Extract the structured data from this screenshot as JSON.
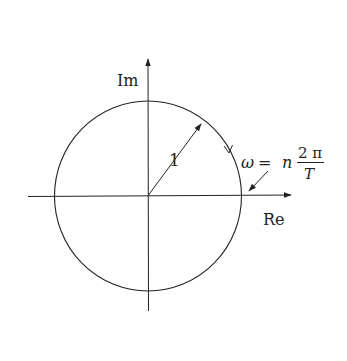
{
  "diagram": {
    "type": "unit-circle-complex-plane",
    "axes": {
      "real_label": "Re",
      "imag_label": "Im"
    },
    "radius_label": "1",
    "frequency_label": {
      "lhs": "ω",
      "equals": "=",
      "n": "n",
      "numerator": "2 π",
      "denominator": "T"
    },
    "rotation_direction": "clockwise",
    "colors": {
      "stroke": "#222222",
      "background": "#ffffff"
    }
  }
}
